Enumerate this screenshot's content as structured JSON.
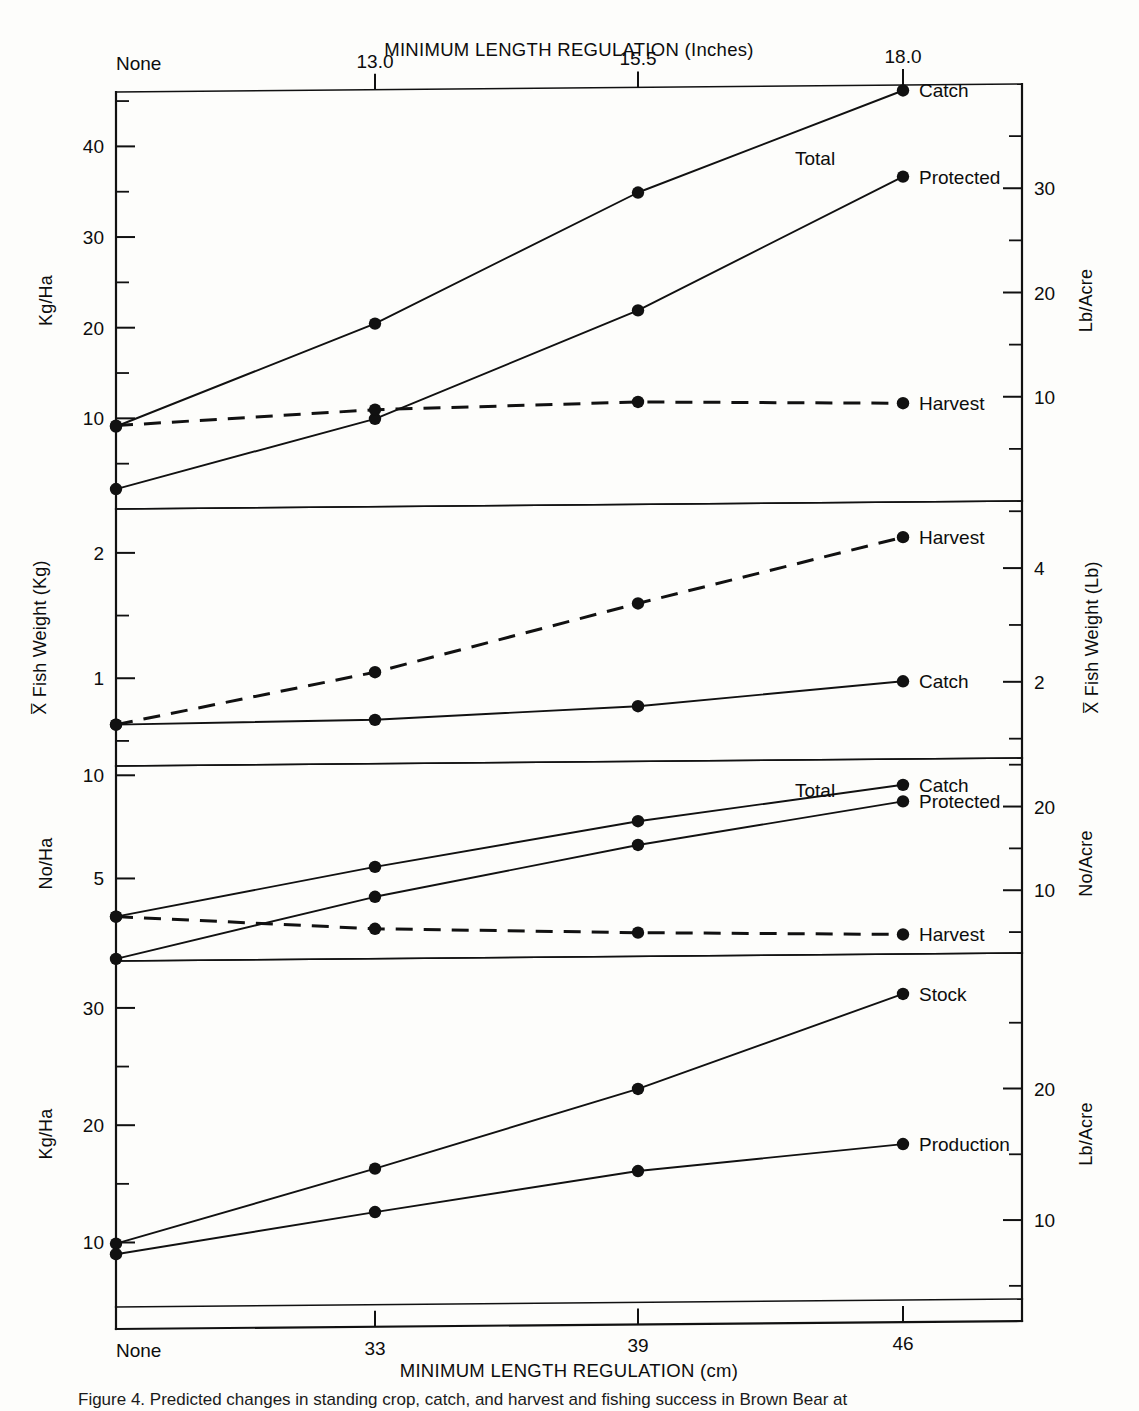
{
  "figure": {
    "top_axis_title": "MINIMUM LENGTH REGULATION (Inches)",
    "bottom_axis_title": "MINIMUM LENGTH REGULATION (cm)",
    "top_tick_labels": [
      "None",
      "13.0",
      "15.5",
      "18.0"
    ],
    "bottom_tick_labels": [
      "None",
      "33",
      "39",
      "46"
    ],
    "caption": "Figure 4. Predicted changes in standing crop, catch, and harvest and fishing success in Brown Bear at"
  },
  "chart_data": {
    "type": "line",
    "xlabel": "MINIMUM LENGTH REGULATION (cm)",
    "x_categories_cm": [
      "None",
      "33",
      "39",
      "46"
    ],
    "x_categories_inches": [
      "None",
      "13.0",
      "15.5",
      "18.0"
    ],
    "grid": false,
    "legend": "inline-right-of-line-ends",
    "panels": [
      {
        "id": "panel-biomass",
        "ylabel_left": "Kg/Ha",
        "ylabel_right": "Lb/Acre",
        "ylim_left": [
          0,
          46
        ],
        "yticks_left": [
          10,
          20,
          30,
          40
        ],
        "yticks_left_minor": [
          5,
          15,
          25,
          35,
          45
        ],
        "ylim_right": [
          0,
          40
        ],
        "yticks_right": [
          10,
          20,
          30
        ],
        "yticks_right_minor": [
          5,
          15,
          25,
          35
        ],
        "series": [
          {
            "name": "Total Catch",
            "label": "Catch",
            "extra_label": "Total",
            "style": "solid",
            "values": [
              9.1,
              20.2,
              34.4,
              45.4
            ]
          },
          {
            "name": "Protected",
            "label": "Protected",
            "style": "solid",
            "values": [
              2.2,
              9.7,
              21.4,
              35.9
            ]
          },
          {
            "name": "Harvest",
            "label": "Harvest",
            "style": "dashed",
            "values": [
              9.2,
              10.7,
              11.3,
              10.9
            ]
          }
        ]
      },
      {
        "id": "panel-fish-weight",
        "ylabel_left": "X̅ Fish Weight (Kg)",
        "ylabel_right": "X̅ Fish Weight (Lb)",
        "ylim_left": [
          0.3,
          2.35
        ],
        "yticks_left": [
          1,
          2
        ],
        "yticks_left_minor": [
          0.5,
          1.5
        ],
        "ylim_right": [
          0.66,
          5.18
        ],
        "yticks_right": [
          2,
          4
        ],
        "yticks_right_minor": [
          1,
          3,
          5
        ],
        "series": [
          {
            "name": "Harvest",
            "label": "Harvest",
            "style": "dashed",
            "values": [
              0.63,
              1.03,
              1.56,
              2.07
            ]
          },
          {
            "name": "Catch",
            "label": "Catch",
            "style": "solid",
            "values": [
              0.63,
              0.65,
              0.74,
              0.92
            ]
          }
        ]
      },
      {
        "id": "panel-numbers",
        "ylabel_left": "No/Ha",
        "ylabel_right": "No/Acre",
        "ylim_left": [
          1.0,
          10.45
        ],
        "yticks_left": [
          5,
          10
        ],
        "yticks_left_minor": [],
        "ylim_right": [
          2.5,
          25.8
        ],
        "yticks_right": [
          10,
          20
        ],
        "yticks_right_minor": [
          5,
          15,
          25
        ],
        "series": [
          {
            "name": "Total Catch",
            "label": "Catch",
            "extra_label": "Total",
            "style": "solid",
            "values": [
              3.15,
              5.45,
              7.55,
              9.2
            ]
          },
          {
            "name": "Protected",
            "label": "Protected",
            "style": "solid",
            "values": [
              1.1,
              4.0,
              6.4,
              8.4
            ]
          },
          {
            "name": "Harvest",
            "label": "Harvest",
            "style": "dashed",
            "values": [
              3.15,
              2.45,
              2.15,
              1.95
            ]
          }
        ]
      },
      {
        "id": "panel-production",
        "ylabel_left": "Kg/Ha",
        "ylabel_right": "Lb/Acre",
        "ylim_left": [
          4.5,
          34.0
        ],
        "yticks_left": [
          10,
          20,
          30
        ],
        "yticks_left_minor": [
          15,
          25
        ],
        "ylim_right": [
          4.0,
          30.3
        ],
        "yticks_right": [
          10,
          20
        ],
        "yticks_right_minor": [
          5,
          15,
          25
        ],
        "series": [
          {
            "name": "Stock",
            "label": "Stock",
            "style": "solid",
            "values": [
              9.9,
              16.1,
              22.7,
              30.6
            ]
          },
          {
            "name": "Production",
            "label": "Production",
            "style": "solid",
            "values": [
              9.0,
              12.4,
              15.7,
              17.8
            ]
          }
        ]
      }
    ]
  }
}
